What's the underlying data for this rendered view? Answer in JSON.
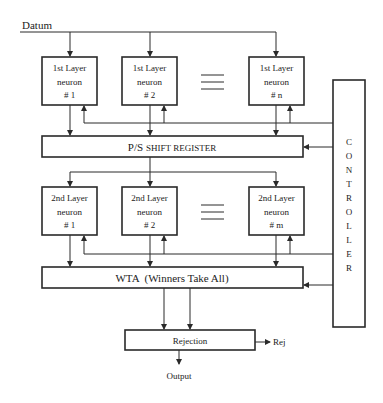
{
  "diagram": {
    "input_label": "Datum",
    "layer1": {
      "neurons": [
        {
          "line1": "1st Layer",
          "line2": "neuron",
          "line3": "# 1"
        },
        {
          "line1": "1st Layer",
          "line2": "neuron",
          "line3": "# 2"
        },
        {
          "line1": "1st Layer",
          "line2": "neuron",
          "line3": "# n"
        }
      ]
    },
    "shift_register": {
      "prefix": "P/S",
      "label": "SHIFT REGISTER"
    },
    "layer2": {
      "neurons": [
        {
          "line1": "2nd Layer",
          "line2": "neuron",
          "line3": "# 1"
        },
        {
          "line1": "2nd Layer",
          "line2": "neuron",
          "line3": "# 2"
        },
        {
          "line1": "2nd Layer",
          "line2": "neuron",
          "line3": "# m"
        }
      ]
    },
    "wta": {
      "label": "WTA  (Winners Take All)"
    },
    "controller": {
      "letters": [
        "C",
        "O",
        "N",
        "T",
        "R",
        "O",
        "L",
        "L",
        "E",
        "R"
      ]
    },
    "rejection": {
      "label": "Rejection",
      "side_output": "Rej"
    },
    "output_label": "Output",
    "colors": {
      "stroke": "#2a2a2a",
      "background": "#ffffff",
      "text": "#222222"
    }
  }
}
